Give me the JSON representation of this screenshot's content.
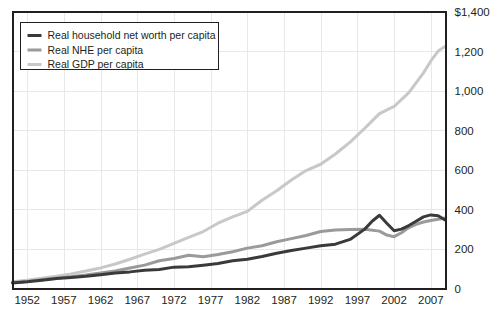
{
  "chart_data": {
    "type": "line",
    "title": "",
    "subtitle": "",
    "xlabel": "",
    "ylabel": "",
    "xlim": [
      1950,
      2009
    ],
    "ylim": [
      0,
      1400
    ],
    "grid": true,
    "legend_position": "top-left",
    "y_ticks": [
      {
        "value": 1400,
        "label": "$1,400"
      },
      {
        "value": 1200,
        "label": "1,200"
      },
      {
        "value": 1000,
        "label": "1,000"
      },
      {
        "value": 800,
        "label": "800"
      },
      {
        "value": 600,
        "label": "600"
      },
      {
        "value": 400,
        "label": "400"
      },
      {
        "value": 200,
        "label": "200"
      },
      {
        "value": 0,
        "label": "0"
      }
    ],
    "x_ticks": [
      {
        "value": 1952,
        "label": "1952"
      },
      {
        "value": 1957,
        "label": "1957"
      },
      {
        "value": 1962,
        "label": "1962"
      },
      {
        "value": 1967,
        "label": "1967"
      },
      {
        "value": 1972,
        "label": "1972"
      },
      {
        "value": 1977,
        "label": "1977"
      },
      {
        "value": 1982,
        "label": "1982"
      },
      {
        "value": 1987,
        "label": "1987"
      },
      {
        "value": 1992,
        "label": "1992"
      },
      {
        "value": 1997,
        "label": "1997"
      },
      {
        "value": 2002,
        "label": "2002"
      },
      {
        "value": 2007,
        "label": "2007"
      }
    ],
    "series": [
      {
        "name": "Real household net worth per capita",
        "color": "#3a3a3a",
        "width": 3.0,
        "x": [
          1950,
          1952,
          1954,
          1956,
          1958,
          1960,
          1962,
          1964,
          1966,
          1968,
          1970,
          1972,
          1974,
          1976,
          1978,
          1980,
          1982,
          1984,
          1986,
          1988,
          1990,
          1992,
          1994,
          1996,
          1998,
          1999,
          2000,
          2001,
          2002,
          2003,
          2004,
          2005,
          2006,
          2007,
          2008,
          2009
        ],
        "values": [
          28,
          34,
          42,
          50,
          56,
          62,
          70,
          78,
          84,
          92,
          96,
          108,
          110,
          118,
          126,
          140,
          148,
          162,
          178,
          192,
          204,
          216,
          224,
          248,
          300,
          340,
          370,
          330,
          292,
          300,
          318,
          340,
          362,
          372,
          368,
          345
        ]
      },
      {
        "name": "Real NHE per capita",
        "color": "#9a9a9a",
        "width": 3.0,
        "x": [
          1950,
          1952,
          1954,
          1956,
          1958,
          1960,
          1962,
          1964,
          1966,
          1968,
          1970,
          1972,
          1974,
          1976,
          1978,
          1980,
          1982,
          1984,
          1986,
          1988,
          1990,
          1992,
          1994,
          1996,
          1998,
          2000,
          2001,
          2002,
          2003,
          2004,
          2005,
          2006,
          2007,
          2008,
          2009
        ],
        "values": [
          30,
          36,
          44,
          52,
          60,
          68,
          78,
          88,
          104,
          118,
          140,
          152,
          168,
          160,
          172,
          186,
          204,
          216,
          236,
          252,
          268,
          288,
          296,
          298,
          300,
          290,
          270,
          262,
          282,
          308,
          324,
          336,
          344,
          350,
          356
        ]
      },
      {
        "name": "Real GDP per capita",
        "color": "#c8c8c8",
        "width": 3.0,
        "x": [
          1950,
          1952,
          1954,
          1956,
          1958,
          1960,
          1962,
          1964,
          1966,
          1968,
          1970,
          1972,
          1974,
          1976,
          1978,
          1980,
          1982,
          1984,
          1986,
          1988,
          1990,
          1992,
          1994,
          1996,
          1998,
          2000,
          2002,
          2004,
          2006,
          2007,
          2008,
          2009
        ],
        "values": [
          34,
          42,
          52,
          62,
          74,
          88,
          104,
          124,
          148,
          174,
          198,
          228,
          258,
          288,
          330,
          362,
          390,
          446,
          494,
          548,
          596,
          628,
          680,
          740,
          810,
          884,
          920,
          990,
          1090,
          1150,
          1200,
          1225
        ]
      }
    ]
  },
  "legend": {
    "items": [
      {
        "label": "Real household net worth per capita",
        "color": "#3a3a3a"
      },
      {
        "label": "Real NHE per capita",
        "color": "#9a9a9a"
      },
      {
        "label": "Real GDP per capita",
        "color": "#c8c8c8"
      }
    ]
  }
}
